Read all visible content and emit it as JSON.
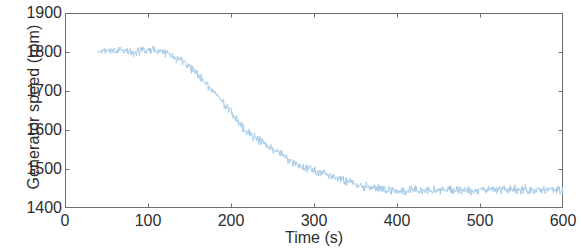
{
  "figure": {
    "background_color": "#ffffff",
    "axis_color": "#6e6e6e",
    "text_color": "#2e2e2e"
  },
  "chart_data": {
    "type": "line",
    "title": "",
    "subtitle": "",
    "xlabel": "Time (s)",
    "ylabel": "Generator speed (rpm)",
    "xlim": [
      0,
      600
    ],
    "ylim": [
      1400,
      1900
    ],
    "xticks": [
      0,
      100,
      200,
      300,
      400,
      500,
      600
    ],
    "yticks": [
      1400,
      1500,
      1600,
      1700,
      1800,
      1900
    ],
    "xtick_labels": [
      "0",
      "100",
      "200",
      "300",
      "400",
      "500",
      "600"
    ],
    "ytick_labels": [
      "1400",
      "1500",
      "1600",
      "1700",
      "1800",
      "1900"
    ],
    "grid": false,
    "box": true,
    "tick_direction": "in",
    "legend": null,
    "annotations": [],
    "series": [
      {
        "name": "Generator speed",
        "color": "#a8cce8",
        "line_width": 1,
        "noise_amplitude_rpm": 14,
        "x_start": 40,
        "x_end": 600,
        "description": "Noisy generator speed signal: plateau near 1800 rpm from 40 s to about 125 s, then a steady ramp down through 1700 rpm at ~175 s, 1600 rpm at ~215 s, 1550 rpm at ~255 s, 1500 rpm at ~300 s, reaching about 1450 rpm by 380 s, then an approximately flat noisy tail around 1445 rpm until 600 s.",
        "x": [
          40,
          50,
          60,
          70,
          80,
          90,
          100,
          110,
          120,
          125,
          130,
          140,
          150,
          160,
          170,
          175,
          180,
          190,
          200,
          210,
          215,
          220,
          230,
          240,
          250,
          255,
          260,
          270,
          280,
          290,
          300,
          310,
          320,
          330,
          340,
          350,
          360,
          370,
          380,
          390,
          400,
          410,
          420,
          430,
          440,
          450,
          460,
          470,
          480,
          490,
          500,
          510,
          520,
          530,
          540,
          550,
          560,
          570,
          580,
          590,
          600
        ],
        "y": [
          1800,
          1803,
          1806,
          1804,
          1800,
          1802,
          1806,
          1804,
          1799,
          1796,
          1790,
          1778,
          1762,
          1744,
          1722,
          1708,
          1698,
          1672,
          1646,
          1618,
          1604,
          1596,
          1580,
          1566,
          1552,
          1546,
          1538,
          1524,
          1512,
          1502,
          1494,
          1490,
          1482,
          1474,
          1468,
          1462,
          1456,
          1452,
          1449,
          1446,
          1445,
          1446,
          1447,
          1445,
          1444,
          1446,
          1447,
          1446,
          1445,
          1444,
          1446,
          1447,
          1445,
          1446,
          1448,
          1447,
          1445,
          1446,
          1447,
          1446,
          1445
        ]
      }
    ]
  }
}
